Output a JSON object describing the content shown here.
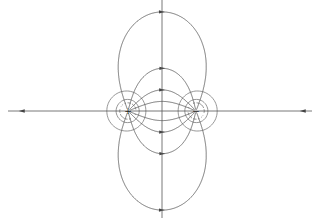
{
  "diagram": {
    "width": 320,
    "height": 218,
    "colors": {
      "background": "#ffffff",
      "field_line": "#555555",
      "equipotential": "#6a6a6a",
      "arrow": "#444444"
    },
    "charges": [
      {
        "label": "+",
        "sign": 1,
        "x": 128,
        "y": 111
      },
      {
        "label": "−",
        "sign": -1,
        "x": 196,
        "y": 111
      }
    ],
    "field_line_start_angles_deg": [
      0,
      22,
      45,
      75,
      110,
      180
    ],
    "equipotential_levels": [
      0.004,
      0.008,
      0.012,
      0.017,
      0.023,
      0.03,
      0.039,
      0.05,
      0.065,
      0.085,
      0.11
    ],
    "axis_arrows": [
      {
        "x": 22,
        "direction": "left"
      },
      {
        "x": 303,
        "direction": "left"
      }
    ]
  }
}
